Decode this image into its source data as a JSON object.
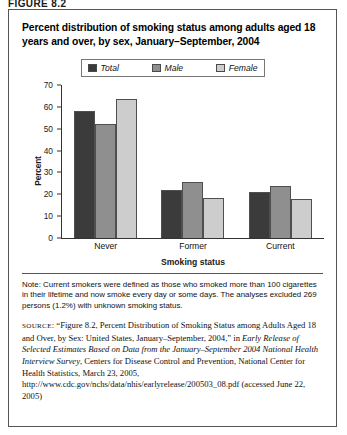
{
  "figure_label": "FIGURE 8.2",
  "chart_title": "Percent distribution of smoking status among adults aged 18 years and over, by sex, January–September, 2004",
  "legend": {
    "items": [
      {
        "label": "Total",
        "color": "#3b3b3b",
        "swatch_name": "legend-swatch-total"
      },
      {
        "label": "Male",
        "color": "#8f8f8f",
        "swatch_name": "legend-swatch-male"
      },
      {
        "label": "Female",
        "color": "#cdcdcd",
        "swatch_name": "legend-swatch-female"
      }
    ]
  },
  "note": "Note: Current smokers were defined as those who smoked more than 100 cigarettes in their lifetime and now smoke every day or some days. The analyses excluded 269 persons (1.2%) with unknown smoking status.",
  "source": {
    "label": "SOURCE",
    "part1": ": “Figure 8.2, Percent Distribution of Smoking Status among Adults Aged 18 and Over, by Sex: United States, January–September, 2004,” in ",
    "italic1": "Early Release of Selected Estimates Based on Data from the January–September 2004 National Health Interview Survey",
    "part2": ", Centers for Disease Control and Prevention, National Center for Health Statistics, March 23, 2005, http://www.cdc.gov/nchs/data/nhis/earlyrelease/200503_08.pdf (accessed June 22, 2005)"
  },
  "chart_data": {
    "type": "bar",
    "title": "Percent distribution of smoking status among adults aged 18 years and over, by sex, January–September, 2004",
    "xlabel": "Smoking status",
    "ylabel": "Percent",
    "categories": [
      "Never",
      "Former",
      "Current"
    ],
    "series": [
      {
        "name": "Total",
        "color": "#3b3b3b",
        "values": [
          58.0,
          22.0,
          21.0
        ]
      },
      {
        "name": "Male",
        "color": "#8f8f8f",
        "values": [
          52.0,
          25.5,
          24.0
        ]
      },
      {
        "name": "Female",
        "color": "#cdcdcd",
        "values": [
          63.5,
          18.5,
          18.0
        ]
      }
    ],
    "ylim": [
      0,
      70
    ],
    "yticks": [
      0,
      10,
      20,
      30,
      40,
      50,
      60,
      70
    ],
    "grid": false,
    "legend_position": "top-center"
  }
}
